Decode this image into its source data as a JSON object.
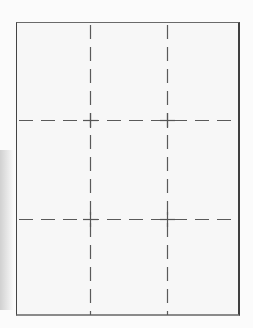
{
  "document": {
    "type": "printable cut-grid template",
    "grid": {
      "rows": 3,
      "columns": 3,
      "line_style": "dashed",
      "line_color": "#555555",
      "border_color": "#4a4a4a",
      "paper_color": "#f7f7f7"
    }
  }
}
